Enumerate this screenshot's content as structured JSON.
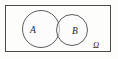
{
  "diagram": {
    "type": "venn",
    "background_color": "#fdfdfc",
    "stroke_color": "#4a4a4a",
    "label_color": "#1d1d1d",
    "universe": {
      "label": "Ω",
      "shape": "rectangle",
      "x": 5.5,
      "y": 5.5,
      "width": 105,
      "height": 46,
      "stroke_width": 1,
      "label_x": 93,
      "label_y": 47
    },
    "sets": [
      {
        "label": "A",
        "shape": "circle",
        "cx": 41,
        "cy": 29,
        "r": 18.5,
        "fill": "#fcfcfc",
        "label_x": 33,
        "label_y": 32.5
      },
      {
        "label": "B",
        "shape": "circle",
        "cx": 72,
        "cy": 30,
        "r": 15.5,
        "fill": "#fcfcfc",
        "label_x": 75,
        "label_y": 33.5
      }
    ],
    "intersection": {
      "label": "",
      "description": "lens-shaped overlap between A and B"
    }
  }
}
